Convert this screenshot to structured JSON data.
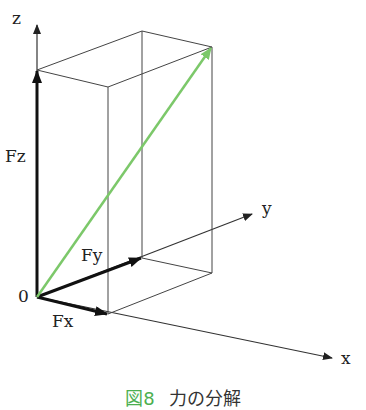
{
  "diagram": {
    "type": "3d-force-decomposition",
    "axes": {
      "x": "x",
      "y": "y",
      "z": "z"
    },
    "origin_label": "0",
    "components": {
      "fx": "Fx",
      "fy": "Fy",
      "fz": "Fz"
    },
    "colors": {
      "resultant": "#7cc86a",
      "components": "#111111",
      "box": "#333333",
      "caption_accent": "#4caf50"
    }
  },
  "caption": {
    "figure_number": "図8",
    "title": "力の分解"
  }
}
